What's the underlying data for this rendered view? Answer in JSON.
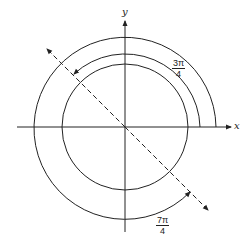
{
  "diagram": {
    "axes": {
      "x_label": "x",
      "y_label": "y"
    },
    "center": [
      125,
      127
    ],
    "unit_circle_radius": 63,
    "angles": [
      {
        "name": "three-pi-over-four",
        "numerator": "3π",
        "denominator": "4",
        "direction": "counterclockwise",
        "radius": 75
      },
      {
        "name": "seven-pi-over-four",
        "numerator": "7π",
        "denominator": "4",
        "direction": "counterclockwise",
        "radius": 91
      }
    ],
    "terminal_line": "dashed line through origin at 3π/4 and 7π/4",
    "colors": {
      "stroke": "#222222",
      "background": "#ffffff"
    }
  }
}
